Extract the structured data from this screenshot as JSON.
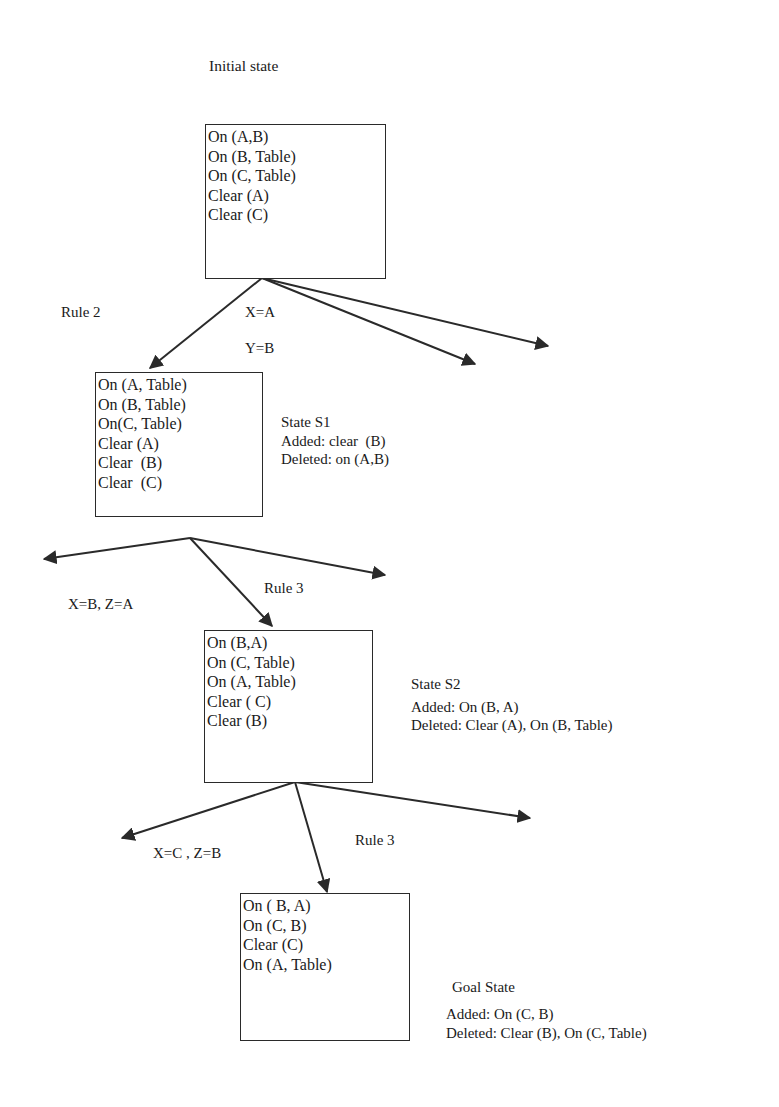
{
  "title": "Initial state",
  "states": [
    {
      "id": "initial",
      "facts": [
        "On (A,B)",
        "On (B, Table)",
        "On (C, Table)",
        "Clear (A)",
        "Clear (C)"
      ]
    },
    {
      "id": "s1",
      "facts": [
        "On (A, Table)",
        "On (B, Table)",
        "On(C, Table)",
        "Clear (A)",
        "Clear  (B)",
        "Clear  (C)"
      ],
      "name": "State S1",
      "added": "Added: clear  (B)",
      "deleted": "Deleted: on (A,B)"
    },
    {
      "id": "s2",
      "facts": [
        "On (B,A)",
        "On (C, Table)",
        "On (A, Table)",
        "Clear ( C)",
        "Clear (B)"
      ],
      "name": "State S2",
      "added": "Added: On (B, A)",
      "deleted": "Deleted: Clear (A), On (B, Table)"
    },
    {
      "id": "goal",
      "facts": [
        "On ( B, A)",
        "On (C, B)",
        "Clear (C)",
        "On (A, Table)"
      ],
      "name": "Goal State",
      "added": "Added: On (C, B)",
      "deleted": "Deleted: Clear (B), On (C, Table)"
    }
  ],
  "transitions": [
    {
      "rule": "Rule 2",
      "bindings": [
        "X=A",
        "Y=B"
      ]
    },
    {
      "rule": "Rule 3",
      "bindings": [
        "X=B, Z=A"
      ]
    },
    {
      "rule": "Rule 3",
      "bindings": [
        "X=C , Z=B"
      ]
    }
  ],
  "colors": {
    "ink": "#1a1a1a",
    "line": "#2a2a2a",
    "background": "#ffffff"
  }
}
